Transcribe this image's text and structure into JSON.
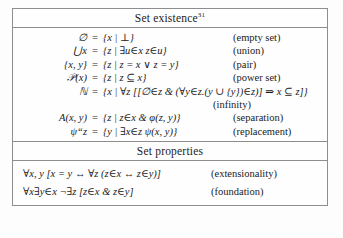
{
  "table": {
    "sections": [
      {
        "id": "set-existence",
        "title": "Set existence",
        "footnote": "31",
        "rows": [
          {
            "lhs": "∅",
            "eq": "=",
            "rhs": "{x | ⊥}",
            "label": "(empty set)"
          },
          {
            "lhs": "⋃x",
            "eq": "=",
            "rhs": "{z | ∃u∈x z∈u}",
            "label": "(union)"
          },
          {
            "lhs": "{x, y}",
            "eq": "=",
            "rhs": "{z | z = x ∨ z = y}",
            "label": "(pair)"
          },
          {
            "lhs": "𝒫(x)",
            "eq": "=",
            "rhs": "{z | z ⊆ x}",
            "label": "(power set)"
          },
          {
            "lhs": "ℕ",
            "eq": "=",
            "rhs": "{x | ∀z [[∅∈z & (∀y∈z.(y ∪ {y})∈z)] ⇒ x ⊆ z]}",
            "label": "(infinity)"
          },
          {
            "lhs": "A(x, y)",
            "eq": "=",
            "rhs": "{z | z∈x & φ(z, y)}",
            "label": "(separation)"
          },
          {
            "lhs": "ψ“z",
            "eq": "=",
            "rhs": "{y | ∃x∈z ψ(x, y)}",
            "label": "(replacement)"
          }
        ]
      },
      {
        "id": "set-properties",
        "title": "Set properties",
        "footnote": "",
        "properties": [
          {
            "formula": "∀x, y [x = y ↔ ∀z (z∈x ↔ z∈y)]",
            "label": "(extensionality)"
          },
          {
            "formula": "∀x∃y∈x ¬∃z [z∈x & z∈y]",
            "label": "(foundation)"
          }
        ]
      }
    ]
  }
}
